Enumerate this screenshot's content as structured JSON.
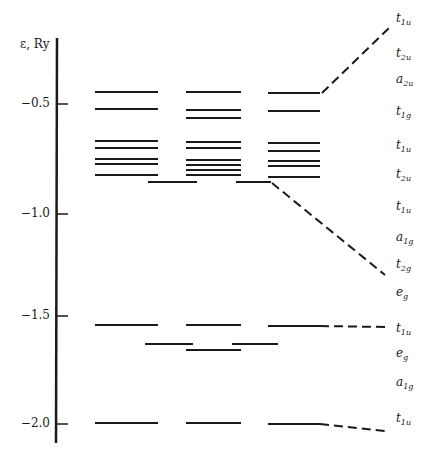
{
  "chart_data": {
    "type": "energy-level-diagram",
    "title": "",
    "ylabel": "ε, Ry",
    "yticks": [
      -0.5,
      -1.0,
      -1.5,
      -2.0
    ],
    "ylim": [
      -2.1,
      -0.3
    ],
    "columns": [
      {
        "name": "left",
        "x_range": [
          95,
          158
        ]
      },
      {
        "name": "middle",
        "x_range": [
          186,
          241
        ]
      },
      {
        "name": "right",
        "x_range": [
          268,
          320
        ]
      }
    ],
    "levels_px": {
      "left": [
        92,
        109,
        141,
        148,
        159,
        164,
        175,
        325,
        423
      ],
      "middle": [
        92,
        110,
        118,
        142,
        148,
        160,
        165,
        170,
        175,
        325,
        350,
        423
      ],
      "right": [
        93,
        111,
        143,
        151,
        161,
        166,
        177,
        326,
        424
      ],
      "between_left_middle": [
        182,
        344
      ],
      "between_middle_right": [
        182,
        344
      ]
    },
    "right_labels": [
      {
        "main": "t",
        "sub": "1u",
        "y": 20
      },
      {
        "main": "t",
        "sub": "2u",
        "y": 55
      },
      {
        "main": "a",
        "sub": "2u",
        "y": 81
      },
      {
        "main": "t",
        "sub": "1g",
        "y": 113
      },
      {
        "main": "t",
        "sub": "1u",
        "y": 147
      },
      {
        "main": "t",
        "sub": "2u",
        "y": 176
      },
      {
        "main": "t",
        "sub": "1u",
        "y": 208
      },
      {
        "main": "a",
        "sub": "1g",
        "y": 239
      },
      {
        "main": "t",
        "sub": "2g",
        "y": 266
      },
      {
        "main": "e",
        "sub": "g",
        "y": 294
      },
      {
        "main": "t",
        "sub": "1u",
        "y": 330
      },
      {
        "main": "e",
        "sub": "g",
        "y": 355
      },
      {
        "main": "a",
        "sub": "1g",
        "y": 384
      },
      {
        "main": "t",
        "sub": "1u",
        "y": 420
      }
    ],
    "dashed_connectors": [
      {
        "from": [
          322,
          93
        ],
        "to": [
          390,
          27
        ]
      },
      {
        "from": [
          272,
          183
        ],
        "to": [
          385,
          275
        ]
      },
      {
        "from": [
          320,
          326
        ],
        "to": [
          385,
          327
        ]
      },
      {
        "from": [
          320,
          424
        ],
        "to": [
          385,
          431
        ]
      }
    ]
  },
  "axis": {
    "title": "ε, Ry",
    "ticks": [
      {
        "label": "−0.5",
        "y": 104
      },
      {
        "label": "−1.0",
        "y": 214
      },
      {
        "label": "−1.5",
        "y": 316
      },
      {
        "label": "−2.0",
        "y": 424
      }
    ]
  }
}
